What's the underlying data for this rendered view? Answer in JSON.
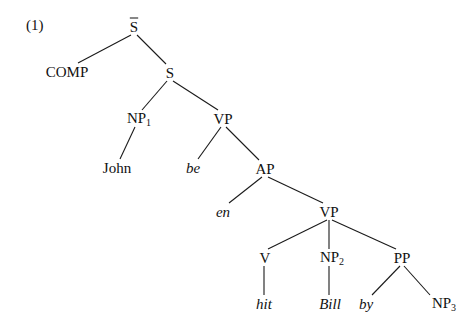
{
  "example_number": "(1)",
  "nodes": {
    "sbar": {
      "label": "S",
      "bar": true,
      "x": 134,
      "y": 27
    },
    "comp": {
      "label": "COMP",
      "x": 67,
      "y": 72
    },
    "s": {
      "label": "S",
      "x": 170,
      "y": 73
    },
    "np1": {
      "label": "NP",
      "sub": "1",
      "x": 137,
      "y": 119
    },
    "vp1": {
      "label": "VP",
      "x": 223,
      "y": 119
    },
    "john": {
      "label": "John",
      "x": 117,
      "y": 168
    },
    "be": {
      "label": "be",
      "italic": true,
      "x": 193,
      "y": 168
    },
    "ap": {
      "label": "AP",
      "x": 265,
      "y": 169
    },
    "en": {
      "label": "en",
      "italic": true,
      "x": 223,
      "y": 212
    },
    "vp2": {
      "label": "VP",
      "x": 329,
      "y": 212
    },
    "v": {
      "label": "V",
      "x": 265,
      "y": 258
    },
    "np2": {
      "label": "NP",
      "sub": "2",
      "x": 330,
      "y": 258
    },
    "pp": {
      "label": "PP",
      "x": 402,
      "y": 258
    },
    "hit": {
      "label": "hit",
      "italic": true,
      "x": 264,
      "y": 304
    },
    "bill": {
      "label": "Bill",
      "italic": true,
      "x": 330,
      "y": 304
    },
    "by": {
      "label": "by",
      "italic": true,
      "x": 366,
      "y": 304
    },
    "np3": {
      "label": "NP",
      "sub": "3",
      "x": 442,
      "y": 304
    }
  },
  "edges": [
    [
      "sbar",
      "comp"
    ],
    [
      "sbar",
      "s"
    ],
    [
      "s",
      "np1"
    ],
    [
      "s",
      "vp1"
    ],
    [
      "np1",
      "john"
    ],
    [
      "vp1",
      "be"
    ],
    [
      "vp1",
      "ap"
    ],
    [
      "ap",
      "en"
    ],
    [
      "ap",
      "vp2"
    ],
    [
      "vp2",
      "v"
    ],
    [
      "vp2",
      "np2"
    ],
    [
      "vp2",
      "pp"
    ],
    [
      "v",
      "hit"
    ],
    [
      "np2",
      "bill"
    ],
    [
      "pp",
      "by"
    ],
    [
      "pp",
      "np3"
    ]
  ]
}
